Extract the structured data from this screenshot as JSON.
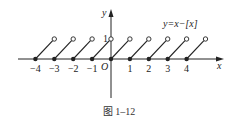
{
  "figure": {
    "caption": "图 1–12",
    "function_label": "y=x−[x]",
    "x_axis_label": "x",
    "y_axis_label": "y",
    "origin_label": "O",
    "y_tick_label": "1",
    "x_tick_labels": [
      "−4",
      "−3",
      "−2",
      "−1",
      "1",
      "2",
      "3",
      "4"
    ],
    "colors": {
      "ink": "#222222",
      "background": "#ffffff"
    }
  },
  "chart_data": {
    "type": "line",
    "title": "y=x−[x]",
    "xlabel": "x",
    "ylabel": "y",
    "caption": "图 1–12",
    "xlim": [
      -4.8,
      5.8
    ],
    "ylim": [
      0,
      1
    ],
    "x_ticks": [
      -4,
      -3,
      -2,
      -1,
      0,
      1,
      2,
      3,
      4
    ],
    "y_ticks": [
      1
    ],
    "series": [
      {
        "name": "y=x−[x] (sawtooth, closed dot at left, open circle at right)",
        "segments": [
          {
            "from": [
              -4,
              0
            ],
            "to": [
              -3,
              1
            ]
          },
          {
            "from": [
              -3,
              0
            ],
            "to": [
              -2,
              1
            ]
          },
          {
            "from": [
              -2,
              0
            ],
            "to": [
              -1,
              1
            ]
          },
          {
            "from": [
              -1,
              0
            ],
            "to": [
              0,
              1
            ]
          },
          {
            "from": [
              0,
              0
            ],
            "to": [
              1,
              1
            ]
          },
          {
            "from": [
              1,
              0
            ],
            "to": [
              2,
              1
            ]
          },
          {
            "from": [
              2,
              0
            ],
            "to": [
              3,
              1
            ]
          },
          {
            "from": [
              3,
              0
            ],
            "to": [
              4,
              1
            ]
          },
          {
            "from": [
              4,
              0
            ],
            "to": [
              5,
              1
            ]
          }
        ]
      }
    ],
    "grid": false,
    "legend": "none"
  }
}
